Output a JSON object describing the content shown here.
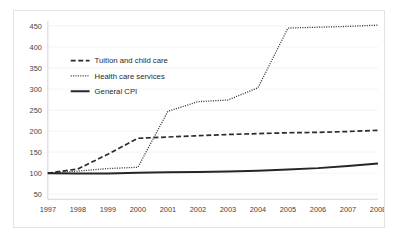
{
  "chart_data": {
    "type": "line",
    "title": "",
    "xlabel": "",
    "ylabel": "",
    "x": [
      1997,
      1998,
      1999,
      2000,
      2001,
      2002,
      2003,
      2004,
      2005,
      2006,
      2007,
      2008
    ],
    "xtick_labels": [
      "1997",
      "1998",
      "1999",
      "2000",
      "2001",
      "2002",
      "2003",
      "2004",
      "2005",
      "2006",
      "2007",
      "2008"
    ],
    "ytick_labels": [
      "50",
      "100",
      "150",
      "200",
      "250",
      "300",
      "350",
      "400",
      "450"
    ],
    "yticks": [
      50,
      100,
      150,
      200,
      250,
      300,
      350,
      400,
      450
    ],
    "xlim": [
      1997,
      2008
    ],
    "ylim": [
      38,
      462
    ],
    "grid": true,
    "legend_position": "upper-left",
    "series": [
      {
        "name": "Tuition and child care",
        "style": "dashed",
        "color": "#2b2b2b",
        "width": 1.7,
        "values": [
          100,
          110,
          145,
          183,
          186,
          189,
          192,
          194,
          196,
          197,
          199,
          202
        ]
      },
      {
        "name": "Health care services",
        "style": "dotted",
        "color": "#3a3a3a",
        "width": 1.3,
        "values": [
          100,
          105,
          111,
          114,
          247,
          270,
          274,
          303,
          445,
          447,
          449,
          452
        ]
      },
      {
        "name": "General CPI",
        "style": "solid",
        "color": "#262626",
        "width": 2.0,
        "values": [
          100,
          99,
          99,
          101,
          102,
          103,
          104,
          106,
          109,
          112,
          117,
          123
        ]
      }
    ]
  },
  "legend": {
    "entries": [
      {
        "label": "Tuition and child care"
      },
      {
        "label": "Health care services"
      },
      {
        "label": "General CPI"
      }
    ]
  }
}
